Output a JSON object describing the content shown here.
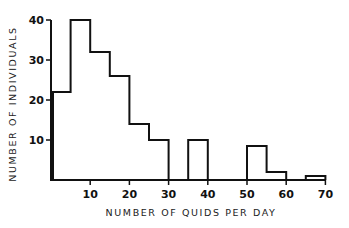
{
  "chart_data": {
    "type": "bar",
    "subtype": "histogram",
    "title": "",
    "xlabel": "NUMBER OF QUIDS PER DAY",
    "ylabel": "NUMBER OF INDIVIDUALS",
    "xlim": [
      0,
      70
    ],
    "ylim": [
      0,
      40
    ],
    "xticks": [
      10,
      20,
      30,
      40,
      50,
      60,
      70
    ],
    "yticks": [
      10,
      20,
      30,
      40
    ],
    "grid": false,
    "legend": null,
    "bins": [
      {
        "start": 0,
        "end": 5,
        "value": 22
      },
      {
        "start": 5,
        "end": 10,
        "value": 40
      },
      {
        "start": 10,
        "end": 15,
        "value": 32
      },
      {
        "start": 15,
        "end": 20,
        "value": 26
      },
      {
        "start": 20,
        "end": 25,
        "value": 14
      },
      {
        "start": 25,
        "end": 30,
        "value": 10
      },
      {
        "start": 30,
        "end": 35,
        "value": 0
      },
      {
        "start": 35,
        "end": 40,
        "value": 10
      },
      {
        "start": 40,
        "end": 45,
        "value": 0
      },
      {
        "start": 45,
        "end": 50,
        "value": 0
      },
      {
        "start": 50,
        "end": 55,
        "value": 8.5
      },
      {
        "start": 55,
        "end": 60,
        "value": 2
      },
      {
        "start": 60,
        "end": 65,
        "value": 0
      },
      {
        "start": 65,
        "end": 70,
        "value": 1
      }
    ],
    "categories": [
      "0-5",
      "5-10",
      "10-15",
      "15-20",
      "20-25",
      "25-30",
      "30-35",
      "35-40",
      "40-45",
      "45-50",
      "50-55",
      "55-60",
      "60-65",
      "65-70"
    ],
    "values": [
      22,
      40,
      32,
      26,
      14,
      10,
      0,
      10,
      0,
      0,
      8.5,
      2,
      0,
      1
    ]
  },
  "layout": {
    "x0_px": 51,
    "px_per_x": 3.92,
    "y0_px": 180,
    "px_per_y": 4.0,
    "line_color": "#111111"
  }
}
